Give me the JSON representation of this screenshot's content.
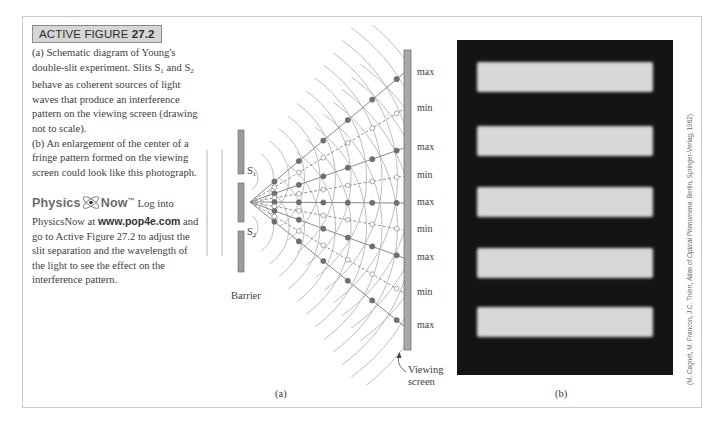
{
  "figure": {
    "tag_prefix": "ACTIVE FIGURE ",
    "tag_number": "27.2",
    "caption": {
      "a_part1": "(a) Schematic diagram of Young's double-slit experiment. Slits S",
      "a_sub1": "1",
      "a_part2": " and S",
      "a_sub2": "2",
      "a_part3": " behave as coherent sources of light waves that produce an interference pattern on the viewing screen (drawing not to scale).",
      "b": "(b) An enlargement of the center of a fringe pattern formed on the viewing screen could look like this photograph."
    },
    "physicsnow": {
      "logo_left": "Physics",
      "logo_right": "Now",
      "trademark": "™",
      "text1": " Log into PhysicsNow at ",
      "url": "www.pop4e.com",
      "text2": " and go to Active Figure 27.2 to adjust the slit separation and the wavelength of the light to see the effect on the interference pattern."
    }
  },
  "diagram": {
    "panel_label": "(a)",
    "barrier_label": "Barrier",
    "slit1": {
      "letter": "S",
      "sub": "1"
    },
    "slit2": {
      "letter": "S",
      "sub": "2"
    },
    "screen_label_line1": "Viewing",
    "screen_label_line2": "screen",
    "screen_marks": [
      {
        "label": "max",
        "y": 73
      },
      {
        "label": "min",
        "y": 109
      },
      {
        "label": "max",
        "y": 148
      },
      {
        "label": "min",
        "y": 176
      },
      {
        "label": "max",
        "y": 203
      },
      {
        "label": "min",
        "y": 230
      },
      {
        "label": "max",
        "y": 258
      },
      {
        "label": "min",
        "y": 293
      },
      {
        "label": "max",
        "y": 326
      }
    ],
    "colors": {
      "wave": "#b5b5b5",
      "barrier": "#9c9c9c",
      "node": "#6e6e6e",
      "screen": "#a8a8a8"
    }
  },
  "photo": {
    "panel_label": "(b)",
    "bright_fringe_tops": [
      22,
      86,
      147,
      208,
      267
    ],
    "credit_prefix": "(M. Cagnet, M. Francon, J.C. Thierr, ",
    "credit_title": "Atlas of Optical Phenomena",
    "credit_suffix": ". Berlin, Springer-Verlag, 1962)"
  }
}
